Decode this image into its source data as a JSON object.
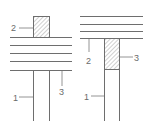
{
  "diagram": {
    "colors": {
      "line": "#6e6e6e",
      "label": "#6a6a6a",
      "hatch": "#8a8a8a",
      "background": "#ffffff"
    },
    "figures": [
      {
        "id": "left",
        "description": "Hatched block on top of layered horizontal lines, with two vertical lines below",
        "labels": {
          "block": "2",
          "vertical_left": "1",
          "vertical_right": "3"
        }
      },
      {
        "id": "right",
        "description": "Layered horizontal lines with hatched block beneath, between two vertical lines",
        "labels": {
          "layer_leader": "2",
          "block": "3",
          "vertical_left": "1"
        }
      }
    ]
  }
}
